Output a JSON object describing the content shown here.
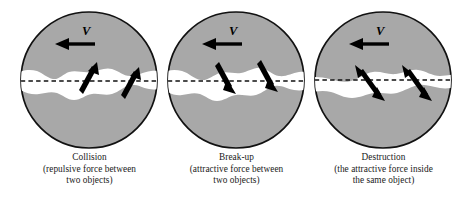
{
  "figure": {
    "type": "scientific-schematic",
    "colors": {
      "body_gray": "#a8a8a8",
      "outline_black": "#111111",
      "interface_white": "#ffffff",
      "arrow_black": "#000000",
      "caption_text": "#1a1a1a",
      "background": "#ffffff"
    }
  },
  "panels": [
    {
      "id": "collision",
      "velocity_label": "V",
      "velocity_direction": "left",
      "force_arrow_type": "single-headed",
      "force_arrow_direction": "up-right",
      "force_arrow_count": 2,
      "caption": {
        "title": "Collision",
        "line2": "(repulsive force between",
        "line3": "two objects)"
      }
    },
    {
      "id": "break-up",
      "velocity_label": "V",
      "velocity_direction": "left",
      "force_arrow_type": "single-headed",
      "force_arrow_direction": "down-right",
      "force_arrow_count": 2,
      "caption": {
        "title": "Break-up",
        "line2": "(attractive force between",
        "line3": "two objects)"
      }
    },
    {
      "id": "destruction",
      "velocity_label": "V",
      "velocity_direction": "left",
      "force_arrow_type": "double-headed",
      "force_arrow_direction": "up-left-and-down-right",
      "force_arrow_count": 2,
      "caption": {
        "title": "Destruction",
        "line2": "(the attractive force inside",
        "line3": "the same object)"
      }
    }
  ]
}
